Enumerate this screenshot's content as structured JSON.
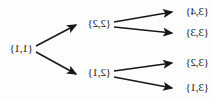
{
  "figure": {
    "type": "tree-diagram",
    "orientation": "mirrored-horizontal",
    "background_color": "#fdfdfd",
    "line_color": "#171717",
    "text_color": "#141414"
  },
  "nodes": {
    "root": {
      "label": "{1,1}"
    },
    "level2": [
      {
        "id": "n22",
        "label": "{2,2}"
      },
      {
        "id": "n21",
        "label": "{2,1}"
      }
    ],
    "level3": [
      {
        "id": "n34",
        "label": "{3,4}"
      },
      {
        "id": "n33",
        "label": "{3,3}"
      },
      {
        "id": "n32",
        "label": "{3,2}"
      },
      {
        "id": "n31",
        "label": "{3,1}"
      }
    ]
  },
  "edges": [
    {
      "from": "{1,1}",
      "to": "{2,2}"
    },
    {
      "from": "{1,1}",
      "to": "{2,1}"
    },
    {
      "from": "{2,2}",
      "to": "{3,4}"
    },
    {
      "from": "{2,2}",
      "to": "{3,3}"
    },
    {
      "from": "{2,1}",
      "to": "{3,2}"
    },
    {
      "from": "{2,1}",
      "to": "{3,1}"
    }
  ]
}
